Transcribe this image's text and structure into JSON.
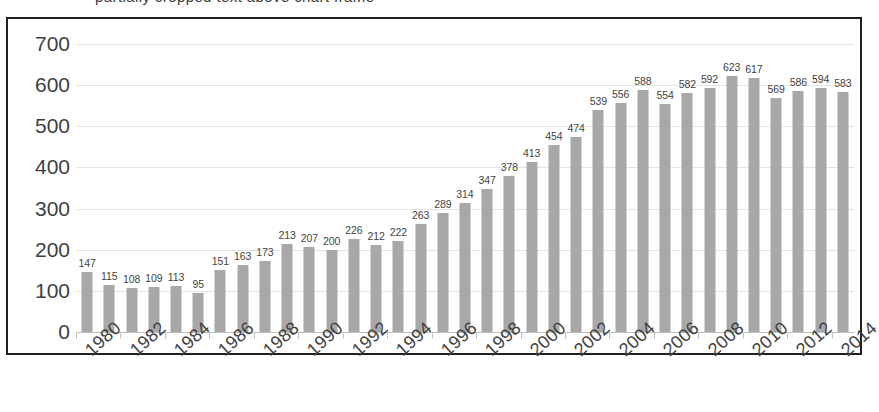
{
  "clipped_caption": "partially cropped text above chart frame",
  "chart_data": {
    "type": "bar",
    "title": "",
    "subtitle": "",
    "xlabel": "",
    "ylabel": "",
    "ylim": [
      0,
      700
    ],
    "ytick_step": 100,
    "ytick_labels": [
      "700",
      "600",
      "500",
      "400",
      "300",
      "200",
      "100",
      "0"
    ],
    "grid": true,
    "legend": false,
    "bar_color": "#a8a8a8",
    "categories": [
      "1980",
      "1981",
      "1982",
      "1983",
      "1984",
      "1985",
      "1986",
      "1987",
      "1988",
      "1989",
      "1990",
      "1991",
      "1992",
      "1993",
      "1994",
      "1995",
      "1996",
      "1997",
      "1998",
      "1999",
      "2000",
      "2001",
      "2002",
      "2003",
      "2004",
      "2005",
      "2006",
      "2007",
      "2008",
      "2009",
      "2010",
      "2011",
      "2012",
      "2013",
      "2014"
    ],
    "values": [
      147,
      115,
      108,
      109,
      113,
      95,
      151,
      163,
      173,
      213,
      207,
      200,
      226,
      212,
      222,
      263,
      289,
      314,
      347,
      378,
      413,
      454,
      474,
      539,
      556,
      588,
      554,
      582,
      592,
      623,
      617,
      569,
      586,
      594,
      583
    ],
    "visible_xtick_labels": [
      "1980",
      "1982",
      "1984",
      "1986",
      "1988",
      "1990",
      "1992",
      "1994",
      "1996",
      "1998",
      "2000",
      "2002",
      "2004",
      "2006",
      "2008",
      "2010",
      "2012",
      "2014"
    ]
  }
}
